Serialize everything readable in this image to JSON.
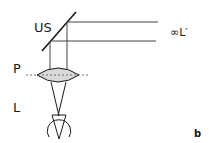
{
  "figure": {
    "panel_label": "b",
    "labels": {
      "beam_splitter": "US",
      "lens": "P",
      "eye": "L",
      "infinity_image": "∞L′"
    },
    "colors": {
      "stroke": "#1a1a1a",
      "lens_fill": "#d9d9d9",
      "background": "#ffffff"
    }
  }
}
